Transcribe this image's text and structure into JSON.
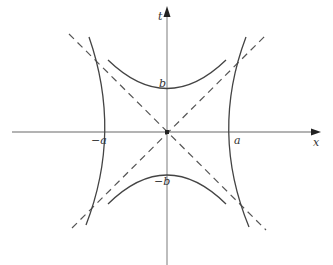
{
  "diagram": {
    "type": "hyperbola-asymptotes",
    "axes": {
      "horizontal_label": "x",
      "vertical_label": "t"
    },
    "labels": {
      "a_pos": "a",
      "a_neg": "−a",
      "b_pos": "b",
      "b_neg": "−b"
    },
    "colors": {
      "axis": "#999999",
      "curve": "#444444",
      "asymptote": "#555555",
      "text": "#333333"
    }
  }
}
